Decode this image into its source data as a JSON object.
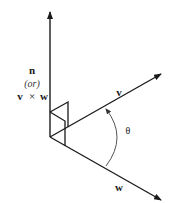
{
  "diagram": {
    "labels": {
      "normal": "n",
      "or": "(or)",
      "cross_left": "v",
      "cross_op": "×",
      "cross_right": "w",
      "vector_v": "v",
      "vector_w": "w",
      "angle": "θ"
    },
    "colors": {
      "stroke": "#1a1a1a",
      "arc": "#555555",
      "background": "#ffffff"
    },
    "elements": [
      {
        "id": "normal-vector",
        "meaning": "n = v × w, perpendicular to v and w"
      },
      {
        "id": "vector-v",
        "meaning": "vector v"
      },
      {
        "id": "vector-w",
        "meaning": "vector w"
      },
      {
        "id": "right-angle-marker-v",
        "meaning": "right angle between n and v"
      },
      {
        "id": "right-angle-marker-w",
        "meaning": "right angle between n and w"
      },
      {
        "id": "angle-arc",
        "meaning": "angle θ from w to v"
      }
    ]
  }
}
